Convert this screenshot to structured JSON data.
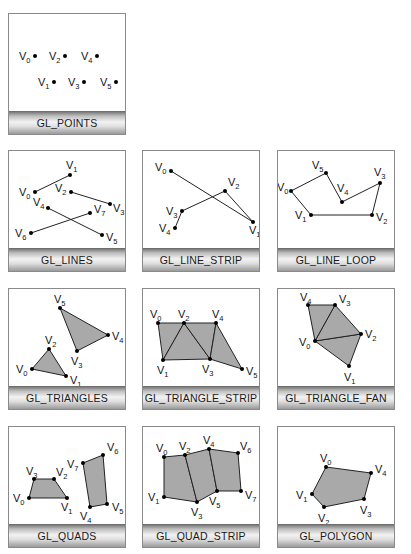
{
  "colors": {
    "fill": "#a9a9a9",
    "stroke": "#222222",
    "panel_border": "#8a8a8a"
  },
  "panels": [
    {
      "id": "points",
      "label": "GL_POINTS",
      "vertices": [
        {
          "name": "V0",
          "x": 26,
          "y": 42,
          "lx": -16,
          "ly": 4
        },
        {
          "name": "V1",
          "x": 45,
          "y": 68,
          "lx": -16,
          "ly": 4
        },
        {
          "name": "V2",
          "x": 56,
          "y": 42,
          "lx": -16,
          "ly": 4
        },
        {
          "name": "V3",
          "x": 75,
          "y": 68,
          "lx": -16,
          "ly": 4
        },
        {
          "name": "V4",
          "x": 88,
          "y": 42,
          "lx": -16,
          "ly": 4
        },
        {
          "name": "V5",
          "x": 107,
          "y": 68,
          "lx": -16,
          "ly": 4
        }
      ]
    },
    {
      "id": "lines",
      "label": "GL_LINES",
      "vertices": [
        {
          "name": "V0",
          "x": 26,
          "y": 41
        },
        {
          "name": "V1",
          "x": 61,
          "y": 24
        },
        {
          "name": "V2",
          "x": 62,
          "y": 41
        },
        {
          "name": "V3",
          "x": 101,
          "y": 53
        },
        {
          "name": "V4",
          "x": 39,
          "y": 57
        },
        {
          "name": "V5",
          "x": 93,
          "y": 84
        },
        {
          "name": "V6",
          "x": 22,
          "y": 82
        },
        {
          "name": "V7",
          "x": 81,
          "y": 62
        }
      ]
    },
    {
      "id": "line_strip",
      "label": "GL_LINE_STRIP",
      "vertices": [
        {
          "name": "V0",
          "x": 28,
          "y": 20
        },
        {
          "name": "V1",
          "x": 110,
          "y": 71
        },
        {
          "name": "V2",
          "x": 82,
          "y": 40
        },
        {
          "name": "V3",
          "x": 39,
          "y": 60
        },
        {
          "name": "V4",
          "x": 32,
          "y": 77
        }
      ]
    },
    {
      "id": "line_loop",
      "label": "GL_LINE_LOOP",
      "vertices": [
        {
          "name": "V0",
          "x": 13,
          "y": 40
        },
        {
          "name": "V1",
          "x": 33,
          "y": 64
        },
        {
          "name": "V2",
          "x": 94,
          "y": 64
        },
        {
          "name": "V3",
          "x": 102,
          "y": 32
        },
        {
          "name": "V4",
          "x": 64,
          "y": 51
        },
        {
          "name": "V5",
          "x": 48,
          "y": 22
        }
      ]
    },
    {
      "id": "triangles",
      "label": "GL_TRIANGLES",
      "vertices": [
        {
          "name": "V0",
          "x": 23,
          "y": 80
        },
        {
          "name": "V1",
          "x": 57,
          "y": 87
        },
        {
          "name": "V2",
          "x": 40,
          "y": 60
        },
        {
          "name": "V3",
          "x": 68,
          "y": 62
        },
        {
          "name": "V4",
          "x": 99,
          "y": 46
        },
        {
          "name": "V5",
          "x": 51,
          "y": 19
        }
      ]
    },
    {
      "id": "triangle_strip",
      "label": "GL_TRIANGLE_STRIP",
      "vertices": [
        {
          "name": "V0",
          "x": 15,
          "y": 34
        },
        {
          "name": "V1",
          "x": 20,
          "y": 71
        },
        {
          "name": "V2",
          "x": 41,
          "y": 34
        },
        {
          "name": "V3",
          "x": 67,
          "y": 70
        },
        {
          "name": "V4",
          "x": 73,
          "y": 34
        },
        {
          "name": "V5",
          "x": 99,
          "y": 80
        }
      ]
    },
    {
      "id": "triangle_fan",
      "label": "GL_TRIANGLE_FAN",
      "vertices": [
        {
          "name": "V0",
          "x": 37,
          "y": 52
        },
        {
          "name": "V1",
          "x": 71,
          "y": 77
        },
        {
          "name": "V2",
          "x": 83,
          "y": 45
        },
        {
          "name": "V3",
          "x": 57,
          "y": 16
        },
        {
          "name": "V4",
          "x": 30,
          "y": 16
        }
      ]
    },
    {
      "id": "quads",
      "label": "GL_QUADS",
      "vertices": [
        {
          "name": "V0",
          "x": 20,
          "y": 71
        },
        {
          "name": "V1",
          "x": 58,
          "y": 71
        },
        {
          "name": "V2",
          "x": 45,
          "y": 52
        },
        {
          "name": "V3",
          "x": 25,
          "y": 52
        },
        {
          "name": "V4",
          "x": 81,
          "y": 80
        },
        {
          "name": "V5",
          "x": 98,
          "y": 77
        },
        {
          "name": "V6",
          "x": 94,
          "y": 28
        },
        {
          "name": "V7",
          "x": 74,
          "y": 36
        }
      ]
    },
    {
      "id": "quad_strip",
      "label": "GL_QUAD_STRIP",
      "vertices": [
        {
          "name": "V0",
          "x": 21,
          "y": 30
        },
        {
          "name": "V1",
          "x": 21,
          "y": 70
        },
        {
          "name": "V2",
          "x": 42,
          "y": 28
        },
        {
          "name": "V3",
          "x": 54,
          "y": 75
        },
        {
          "name": "V4",
          "x": 66,
          "y": 22
        },
        {
          "name": "V5",
          "x": 74,
          "y": 64
        },
        {
          "name": "V6",
          "x": 95,
          "y": 26
        },
        {
          "name": "V7",
          "x": 98,
          "y": 64
        }
      ]
    },
    {
      "id": "polygon",
      "label": "GL_POLYGON",
      "vertices": [
        {
          "name": "V0",
          "x": 48,
          "y": 40
        },
        {
          "name": "V1",
          "x": 34,
          "y": 67
        },
        {
          "name": "V2",
          "x": 46,
          "y": 80
        },
        {
          "name": "V3",
          "x": 86,
          "y": 72
        },
        {
          "name": "V4",
          "x": 93,
          "y": 46
        }
      ]
    }
  ]
}
